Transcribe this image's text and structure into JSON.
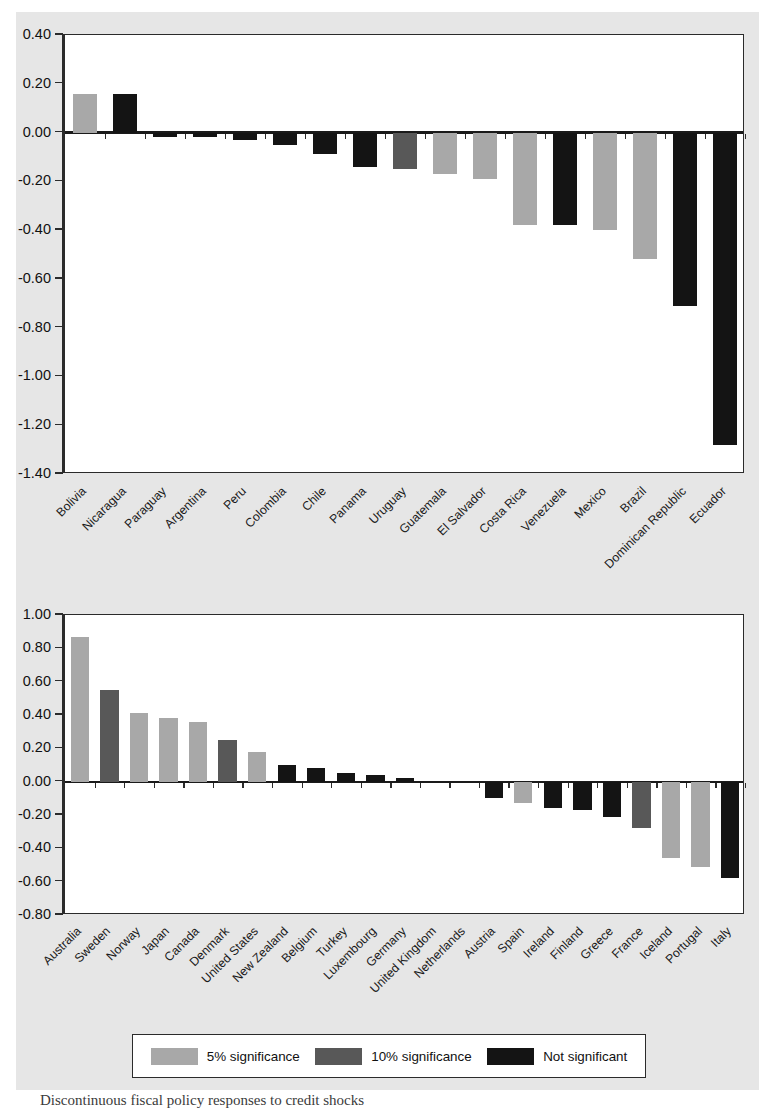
{
  "legend": {
    "items": [
      {
        "label": "5% significance",
        "key": "sig5",
        "color": "#a8a8a8"
      },
      {
        "label": "10% significance",
        "key": "sig10",
        "color": "#585858"
      },
      {
        "label": "Not significant",
        "key": "nosig",
        "color": "#141414"
      }
    ]
  },
  "caption": "Discontinuous fiscal policy responses to credit shocks",
  "chart_data": [
    {
      "type": "bar",
      "title": "LAC",
      "xlabel": "",
      "ylabel": "",
      "ylim": [
        -1.4,
        0.4
      ],
      "ytick_labels": [
        "0.40",
        "0.20",
        "0.00",
        "-0.20",
        "-0.40",
        "-0.60",
        "-0.80",
        "-1.00",
        "-1.20",
        "-1.40"
      ],
      "ytick_values": [
        0.4,
        0.2,
        0.0,
        -0.2,
        -0.4,
        -0.6,
        -0.8,
        -1.0,
        -1.2,
        -1.4
      ],
      "grid": false,
      "legend_position": "bottom",
      "categories": [
        "Bolivia",
        "Nicaragua",
        "Paraguay",
        "Argentina",
        "Peru",
        "Colombia",
        "Chile",
        "Panama",
        "Uruguay",
        "Guatemala",
        "El Salvador",
        "Costa Rica",
        "Venezuela",
        "Mexico",
        "Brazil",
        "Dominican Republic",
        "Ecuador"
      ],
      "values": [
        0.16,
        0.16,
        -0.02,
        -0.02,
        -0.03,
        -0.05,
        -0.09,
        -0.14,
        -0.15,
        -0.17,
        -0.19,
        -0.38,
        -0.38,
        -0.4,
        -0.52,
        -0.71,
        -1.28
      ],
      "significance": [
        "sig5",
        "nosig",
        "nosig",
        "nosig",
        "nosig",
        "nosig",
        "nosig",
        "nosig",
        "sig10",
        "sig5",
        "sig5",
        "sig5",
        "nosig",
        "sig5",
        "sig5",
        "nosig",
        "nosig"
      ]
    },
    {
      "type": "bar",
      "title": "Developed countries",
      "xlabel": "",
      "ylabel": "",
      "ylim": [
        -0.8,
        1.0
      ],
      "ytick_labels": [
        "1.00",
        "0.80",
        "0.60",
        "0.40",
        "0.20",
        "0.00",
        "-0.20",
        "-0.40",
        "-0.60",
        "-0.80"
      ],
      "ytick_values": [
        1.0,
        0.8,
        0.6,
        0.4,
        0.2,
        0.0,
        -0.2,
        -0.4,
        -0.6,
        -0.8
      ],
      "grid": false,
      "legend_position": "bottom",
      "categories": [
        "Australia",
        "Sweden",
        "Norway",
        "Japan",
        "Canada",
        "Denmark",
        "United States",
        "New Zealand",
        "Belgium",
        "Turkey",
        "Luxembourg",
        "Germany",
        "United Kingdom",
        "Netherlands",
        "Austria",
        "Spain",
        "Ireland",
        "Finland",
        "Greece",
        "France",
        "Iceland",
        "Portugal",
        "Italy"
      ],
      "values": [
        0.87,
        0.55,
        0.41,
        0.38,
        0.36,
        0.25,
        0.18,
        0.1,
        0.08,
        0.05,
        0.04,
        0.02,
        0.0,
        0.0,
        -0.1,
        -0.13,
        -0.16,
        -0.17,
        -0.21,
        -0.28,
        -0.46,
        -0.51,
        -0.58
      ],
      "significance": [
        "sig5",
        "sig10",
        "sig5",
        "sig5",
        "sig5",
        "sig10",
        "sig5",
        "nosig",
        "nosig",
        "nosig",
        "nosig",
        "nosig",
        "nosig",
        "nosig",
        "nosig",
        "sig5",
        "nosig",
        "nosig",
        "nosig",
        "sig10",
        "sig5",
        "sig5",
        "nosig"
      ]
    }
  ]
}
